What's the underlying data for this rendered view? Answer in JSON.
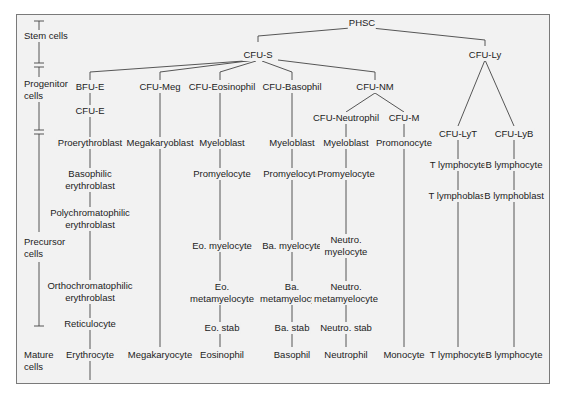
{
  "diagram": {
    "stages": {
      "stem": "Stem cells",
      "progenitor": "Progenitor cells",
      "precursor": "Precursor cells",
      "mature": "Mature cells"
    },
    "root": "PHSC",
    "level1": {
      "cfu_s": "CFU-S",
      "cfu_ly": "CFU-Ly"
    },
    "progenitors": {
      "bfu_e": "BFU-E",
      "cfu_e": "CFU-E",
      "cfu_meg": "CFU-Meg",
      "cfu_eos": "CFU-Eosinophil",
      "cfu_baso": "CFU-Basophil",
      "cfu_nm": "CFU-NM",
      "cfu_neut": "CFU-Neutrophil",
      "cfu_m": "CFU-M",
      "cfu_lyt": "CFU-LyT",
      "cfu_lyb": "CFU-LyB"
    },
    "erythroid": [
      "Proerythroblast",
      "Basophilic erythroblast",
      "Polychromatophilic erythroblast",
      "Orthochromatophilic erythroblast",
      "Reticulocyte",
      "Erythrocyte"
    ],
    "megakaryocytic": [
      "Megakaryoblast",
      "Megakaryocyte"
    ],
    "eosinophil": [
      "Myeloblast",
      "Promyelocyte",
      "Eo. myelocyte",
      "Eo. metamyelocyte",
      "Eo. stab",
      "Eosinophil"
    ],
    "basophil": [
      "Myeloblast",
      "Promyelocyte",
      "Ba. myelocyte",
      "Ba. metamyelocyte",
      "Ba. stab",
      "Basophil"
    ],
    "neutrophil": [
      "Myeloblast",
      "Promyelocyte",
      "Neutro. myelocyte",
      "Neutro. metamyelocyte",
      "Neutro. stab",
      "Neutrophil"
    ],
    "monocyte": [
      "Promonocyte",
      "Monocyte"
    ],
    "t_lineage": [
      "T lymphocyte",
      "T lymphoblast",
      "T lymphocyte"
    ],
    "b_lineage": [
      "B lymphocyte",
      "B lymphoblast",
      "B lymphocyte"
    ]
  }
}
